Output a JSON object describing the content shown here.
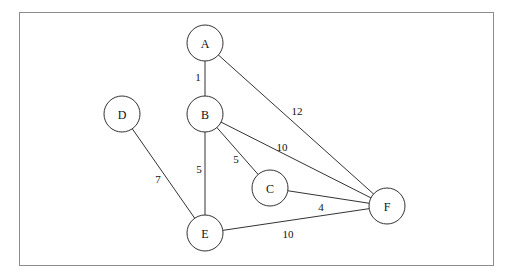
{
  "diagram": {
    "type": "weighted-undirected-graph",
    "frame": {
      "x": 19,
      "y": 12,
      "width": 474,
      "height": 253,
      "stroke": "#8c8c8c"
    },
    "node_radius": 18,
    "nodes": [
      {
        "id": "A",
        "label": "A",
        "x": 205,
        "y": 43
      },
      {
        "id": "B",
        "label": "B",
        "x": 205,
        "y": 114
      },
      {
        "id": "C",
        "label": "C",
        "x": 270,
        "y": 188
      },
      {
        "id": "D",
        "label": "D",
        "x": 122,
        "y": 114
      },
      {
        "id": "E",
        "label": "E",
        "x": 205,
        "y": 233
      },
      {
        "id": "F",
        "label": "F",
        "x": 387,
        "y": 206
      }
    ],
    "edges": [
      {
        "from": "A",
        "to": "B",
        "weight": "1",
        "label_x": 198,
        "label_y": 77
      },
      {
        "from": "A",
        "to": "F",
        "weight": "12",
        "label_x": 297,
        "label_y": 111
      },
      {
        "from": "B",
        "to": "F",
        "weight": "10",
        "label_x": 282,
        "label_y": 147
      },
      {
        "from": "B",
        "to": "C",
        "weight": "5",
        "label_x": 236,
        "label_y": 159
      },
      {
        "from": "B",
        "to": "E",
        "weight": "5",
        "label_x": 199,
        "label_y": 169
      },
      {
        "from": "D",
        "to": "E",
        "weight": "7",
        "label_x": 158,
        "label_y": 179
      },
      {
        "from": "C",
        "to": "F",
        "weight": "4",
        "label_x": 321,
        "label_y": 207
      },
      {
        "from": "E",
        "to": "F",
        "weight": "10",
        "label_x": 288,
        "label_y": 234
      }
    ]
  }
}
